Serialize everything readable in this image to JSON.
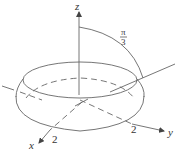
{
  "diagram": {
    "axes": {
      "x": {
        "label": "x",
        "tick": "2"
      },
      "y": {
        "label": "y",
        "tick": "2"
      },
      "z": {
        "label": "z"
      }
    },
    "angle_label": {
      "numerator": "π",
      "denominator": "3"
    },
    "colors": {
      "stroke": "#555555",
      "text": "#333333",
      "background": "#ffffff"
    }
  }
}
